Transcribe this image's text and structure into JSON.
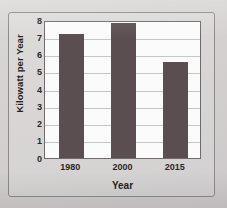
{
  "chart_data": {
    "type": "bar",
    "title": "",
    "categories": [
      "1980",
      "2000",
      "2015"
    ],
    "values": [
      7.2,
      7.85,
      5.55
    ],
    "xlabel": "Year",
    "ylabel": "Kilowatt per Year",
    "ylim": [
      0,
      8
    ],
    "yticks": [
      "0",
      "1",
      "2",
      "3",
      "4",
      "5",
      "6",
      "7",
      "8"
    ],
    "grid": true,
    "legend": "none",
    "bar_color": "#5a4e50",
    "plot_background": "#fbfbfb",
    "page_background": "#d8d4d4",
    "frame_color": "#8e8a8b",
    "axis_color": "#6f6b6c",
    "gridline_color": "#c8c6c6",
    "text_color": "#231f20"
  }
}
